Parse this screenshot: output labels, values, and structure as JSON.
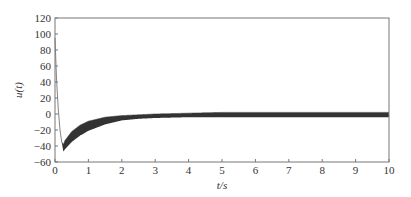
{
  "chart_data": {
    "type": "line",
    "title": "",
    "xlabel": "t/s",
    "ylabel": "u(t)",
    "xlim": [
      0,
      10
    ],
    "ylim": [
      -60,
      120
    ],
    "xticks": [
      0,
      1,
      2,
      3,
      4,
      5,
      6,
      7,
      8,
      9,
      10
    ],
    "yticks": [
      -60,
      -40,
      -20,
      0,
      20,
      40,
      60,
      80,
      100,
      120
    ],
    "grid": false,
    "legend": null,
    "series": [
      {
        "name": "u(t)",
        "style": "dense oscillating band (upper/lower envelope)",
        "x": [
          0,
          0.05,
          0.1,
          0.15,
          0.2,
          0.25,
          0.3,
          0.5,
          0.75,
          1.0,
          1.5,
          2.0,
          2.5,
          3.0,
          4.0,
          5.0,
          7.0,
          10.0
        ],
        "upper": [
          95,
          40,
          5,
          -20,
          -35,
          -38,
          -33,
          -22,
          -14,
          -9,
          -4,
          -2,
          -1,
          0,
          1,
          2,
          2,
          2
        ],
        "lower": [
          95,
          40,
          5,
          -20,
          -35,
          -47,
          -44,
          -35,
          -27,
          -21,
          -13,
          -8,
          -6,
          -5,
          -4,
          -4,
          -4,
          -4
        ]
      }
    ],
    "color": "#333333"
  },
  "labels": {
    "xlabel": "t/s",
    "ylabel": "u(t)"
  }
}
